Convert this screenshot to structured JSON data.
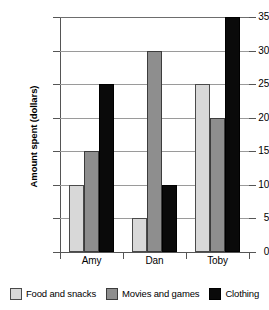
{
  "chart_data": {
    "type": "bar",
    "title": "",
    "xlabel": "",
    "ylabel": "Amount spent (dollars)",
    "categories": [
      "Amy",
      "Dan",
      "Toby"
    ],
    "series": [
      {
        "name": "Food and snacks",
        "color": "#d8d8d8",
        "values": [
          10,
          5,
          25
        ]
      },
      {
        "name": "Movies and games",
        "color": "#8e8e8e",
        "values": [
          15,
          30,
          20
        ]
      },
      {
        "name": "Clothing",
        "color": "#0a0a0a",
        "values": [
          25,
          10,
          35
        ]
      }
    ],
    "ylim": [
      0,
      35
    ],
    "ytick_step": 5,
    "ytick_labels": [
      "0",
      "5",
      "10",
      "15",
      "20",
      "25",
      "30",
      "35"
    ],
    "grid": true,
    "legend_position": "bottom"
  }
}
